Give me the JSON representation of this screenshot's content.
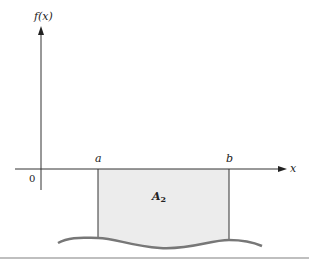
{
  "diagram": {
    "y_axis_label": "f(x)",
    "x_axis_label": "x",
    "origin_label": "0",
    "lower_limit_label": "a",
    "upper_limit_label": "b",
    "region_label_main": "A",
    "region_label_sub": "2",
    "colors": {
      "axis": "#333333",
      "region_fill": "#ececec",
      "curve": "#777777",
      "divider": "#aaaaaa"
    }
  }
}
